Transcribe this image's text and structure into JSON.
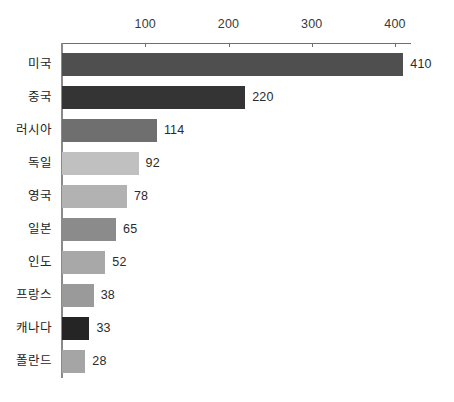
{
  "chart_data": {
    "type": "bar",
    "orientation": "horizontal",
    "title": "",
    "xlabel": "",
    "ylabel": "",
    "categories": [
      "미국",
      "중국",
      "러시아",
      "독일",
      "영국",
      "일본",
      "인도",
      "프랑스",
      "캐나다",
      "폴란드"
    ],
    "values": [
      410,
      220,
      114,
      92,
      78,
      65,
      52,
      38,
      33,
      28
    ],
    "value_labels": [
      "410",
      "220",
      "114",
      "92",
      "78",
      "65",
      "52",
      "38",
      "33",
      "28"
    ],
    "bar_colors": [
      "#4f4f4f",
      "#343434",
      "#6f6f6f",
      "#c0c0c0",
      "#b2b2b2",
      "#8b8b8b",
      "#a8a8a8",
      "#9a9a9a",
      "#252525",
      "#a5a5a5"
    ],
    "xlim": [
      0,
      430
    ],
    "xticks": [
      100,
      200,
      300,
      400
    ],
    "xtick_labels": [
      "100",
      "200",
      "300",
      "400"
    ],
    "axis_position": "top",
    "grid": false,
    "legend": "none",
    "axis_color": "#6f6f6f"
  }
}
